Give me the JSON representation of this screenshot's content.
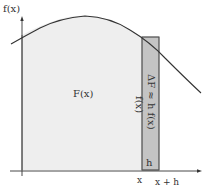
{
  "diagram": {
    "y_axis_label": "f(x)",
    "area_label": "F(x)",
    "height_label": "f(x)",
    "strip_label": "ΔF ≈ h f(x)",
    "width_label": "h",
    "x_tick_left": "x",
    "x_tick_right": "x + h"
  },
  "colors": {
    "area_fill": "#eeeeee",
    "strip_fill": "#c4c4c4",
    "axis": "#333333",
    "curve": "#333333",
    "text": "#333333"
  }
}
